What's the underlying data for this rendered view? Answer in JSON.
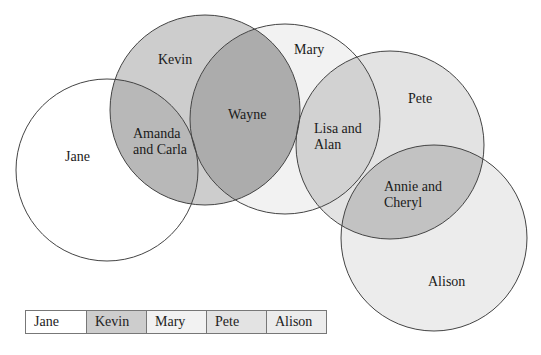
{
  "diagram": {
    "type": "venn",
    "sets": [
      {
        "id": "jane",
        "label": "Jane",
        "fill": "#ffffff"
      },
      {
        "id": "kevin",
        "label": "Kevin",
        "fill": "#cdcdcd"
      },
      {
        "id": "mary",
        "label": "Mary",
        "fill": "#f2f2f2"
      },
      {
        "id": "pete",
        "label": "Pete",
        "fill": "#e3e3e3"
      },
      {
        "id": "alison",
        "label": "Alison",
        "fill": "#ececec"
      }
    ],
    "intersections": [
      {
        "sets": [
          "jane",
          "kevin"
        ],
        "label_line1": "Amanda",
        "label_line2": "and Carla",
        "fill": "#b8b8b8"
      },
      {
        "sets": [
          "kevin",
          "mary"
        ],
        "label": "Wayne",
        "fill": "#acacac"
      },
      {
        "sets": [
          "mary",
          "pete"
        ],
        "label_line1": "Lisa and",
        "label_line2": "Alan",
        "fill": "#d2d2d2"
      },
      {
        "sets": [
          "pete",
          "alison"
        ],
        "label_line1": "Annie and",
        "label_line2": "Cheryl",
        "fill": "#c2c2c2"
      }
    ],
    "labels": {
      "jane": "Jane",
      "kevin": "Kevin",
      "mary": "Mary",
      "pete": "Pete",
      "alison": "Alison",
      "wayne": "Wayne",
      "amanda_1": "Amanda",
      "amanda_2": "and Carla",
      "lisa_1": "Lisa and",
      "lisa_2": "Alan",
      "annie_1": "Annie and",
      "annie_2": "Cheryl"
    }
  },
  "legend": {
    "items": [
      "Jane",
      "Kevin",
      "Mary",
      "Pete",
      "Alison"
    ],
    "fills": [
      "#ffffff",
      "#cdcdcd",
      "#f2f2f2",
      "#e3e3e3",
      "#ececec"
    ]
  }
}
